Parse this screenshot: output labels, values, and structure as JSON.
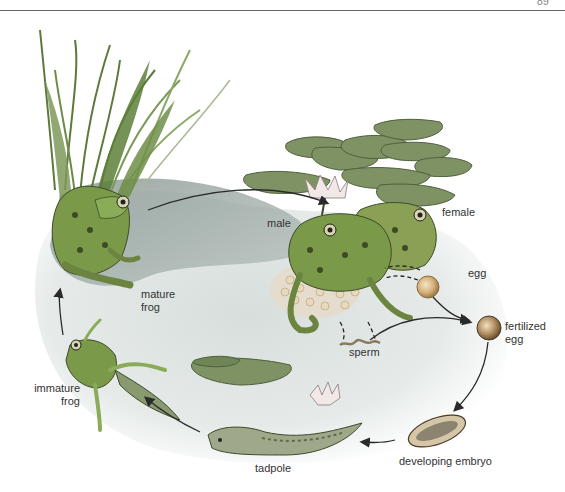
{
  "page": {
    "number": "89"
  },
  "diagram": {
    "colors": {
      "water": "#c9d3d3",
      "water_dark": "#8c9a96",
      "frog": "#7a9a4a",
      "frog_spots": "#3d4a28",
      "lily_pad": "#7e9264",
      "reed": "#6d8a4a",
      "egg": "#d9b98a",
      "arrow": "#2a2a2a"
    },
    "labels": {
      "male": "male",
      "female": "female",
      "egg": "egg",
      "fertilized_egg_1": "fertilized",
      "fertilized_egg_2": "egg",
      "sperm": "sperm",
      "mature_frog_1": "mature",
      "mature_frog_2": "frog",
      "immature_frog_1": "immature",
      "immature_frog_2": "frog",
      "tadpole": "tadpole",
      "developing_embryo": "developing embryo"
    },
    "stages": [
      "mature frog",
      "male",
      "female",
      "egg",
      "sperm",
      "fertilized egg",
      "developing embryo",
      "tadpole",
      "immature frog"
    ]
  }
}
